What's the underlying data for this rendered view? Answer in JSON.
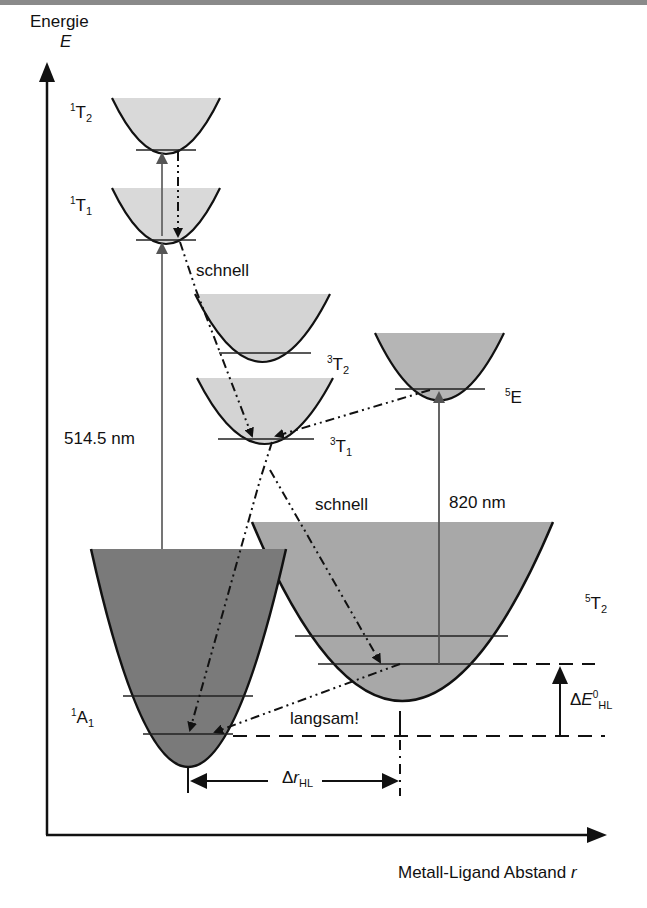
{
  "diagram": {
    "y_axis": {
      "label": "Energie",
      "symbol": "E"
    },
    "x_axis": {
      "label": "Metall-Ligand Abstand",
      "symbol": "r"
    },
    "states": [
      {
        "id": "1T2",
        "mult": "1",
        "term": "T",
        "sub": "2",
        "fill": "#d9d9d9"
      },
      {
        "id": "1T1",
        "mult": "1",
        "term": "T",
        "sub": "1",
        "fill": "#d9d9d9"
      },
      {
        "id": "3T2",
        "mult": "3",
        "term": "T",
        "sub": "2",
        "fill": "#d4d4d4"
      },
      {
        "id": "3T1",
        "mult": "3",
        "term": "T",
        "sub": "1",
        "fill": "#d4d4d4"
      },
      {
        "id": "5E",
        "mult": "5",
        "term": "E",
        "sub": "",
        "fill": "#b5b5b5"
      },
      {
        "id": "5T2",
        "mult": "5",
        "term": "T",
        "sub": "2",
        "fill": "#a8a8a8"
      },
      {
        "id": "1A1",
        "mult": "1",
        "term": "A",
        "sub": "1",
        "fill": "#7a7a7a"
      }
    ],
    "transitions": {
      "excitation_ls": "514.5 nm",
      "excitation_hs": "820 nm",
      "fast_1": "schnell",
      "fast_2": "schnell",
      "slow": "langsam!"
    },
    "delta_r": {
      "prefix": "Δ",
      "symbol": "r",
      "sub": "HL"
    },
    "delta_e": {
      "prefix": "Δ",
      "symbol": "E",
      "sup": "0",
      "sub": "HL"
    }
  }
}
